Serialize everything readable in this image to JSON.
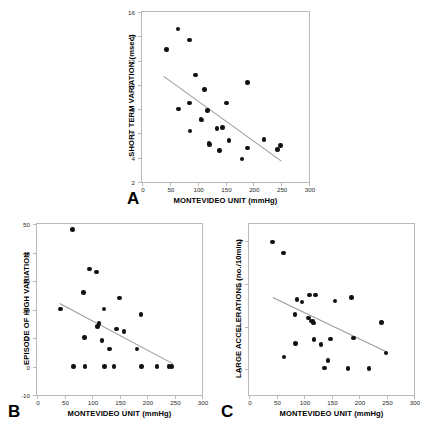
{
  "figure": {
    "panel_count": 3,
    "marker_color": "#111111",
    "fit_line_color": "#9a9a9a",
    "frame_color": "#b9b9b9"
  },
  "chart_data": [
    {
      "panel": "A",
      "type": "scatter",
      "title": "",
      "xlabel": "MONTEVIDEO UNIT (mmHg)",
      "ylabel": "SHORT TERM VARIATION (msec)",
      "xlim": [
        0,
        300
      ],
      "ylim": [
        2,
        16
      ],
      "xticks": [
        0,
        50,
        100,
        150,
        200,
        250,
        300
      ],
      "yticks": [
        2,
        4,
        6,
        8,
        10,
        12,
        14,
        16
      ],
      "grid": false,
      "legend": null,
      "points": [
        [
          44,
          12.9
        ],
        [
          65,
          14.6
        ],
        [
          66,
          8.0
        ],
        [
          85,
          13.7
        ],
        [
          85,
          8.5
        ],
        [
          86,
          6.2
        ],
        [
          96,
          10.8
        ],
        [
          106,
          7.2
        ],
        [
          107,
          7.1
        ],
        [
          112,
          9.6
        ],
        [
          118,
          7.9
        ],
        [
          120,
          5.2
        ],
        [
          121,
          5.1
        ],
        [
          135,
          6.4
        ],
        [
          139,
          4.6
        ],
        [
          145,
          6.5
        ],
        [
          152,
          8.5
        ],
        [
          156,
          5.4
        ],
        [
          180,
          3.9
        ],
        [
          189,
          10.2
        ],
        [
          190,
          4.8
        ],
        [
          219,
          5.5
        ],
        [
          243,
          4.7
        ],
        [
          249,
          5.0
        ]
      ],
      "fit_line": {
        "x0": 40,
        "y0": 10.7,
        "x1": 252,
        "y1": 3.7
      }
    },
    {
      "panel": "B",
      "type": "scatter",
      "title": "",
      "xlabel": "MONTEVIDEO UNIT (mmHg)",
      "ylabel": "EPISODE OF HIGH VARIATION",
      "xlim": [
        0,
        300
      ],
      "ylim": [
        -10,
        50
      ],
      "xticks": [
        0,
        50,
        100,
        150,
        200,
        250,
        300
      ],
      "yticks": [
        -10,
        0,
        10,
        20,
        30,
        40,
        50
      ],
      "grid": false,
      "legend": null,
      "points": [
        [
          43,
          20.2
        ],
        [
          65,
          48.0
        ],
        [
          66,
          0.0
        ],
        [
          85,
          26.0
        ],
        [
          86,
          10.2
        ],
        [
          87,
          0.0
        ],
        [
          95,
          34.2
        ],
        [
          108,
          33.1
        ],
        [
          110,
          14.0
        ],
        [
          113,
          15.1
        ],
        [
          118,
          9.1
        ],
        [
          122,
          20.2
        ],
        [
          123,
          0.0
        ],
        [
          132,
          6.1
        ],
        [
          140,
          0.0
        ],
        [
          145,
          13.1
        ],
        [
          150,
          24.0
        ],
        [
          158,
          12.2
        ],
        [
          182,
          6.1
        ],
        [
          189,
          18.2
        ],
        [
          190,
          0.0
        ],
        [
          218,
          0.0
        ],
        [
          240,
          0.0
        ],
        [
          245,
          0.0
        ]
      ],
      "fit_line": {
        "x0": 42,
        "y0": 22.2,
        "x1": 248,
        "y1": 1.0
      }
    },
    {
      "panel": "C",
      "type": "scatter",
      "title": "",
      "xlabel": "MONTEVIDEO UNIT (mmHg)",
      "ylabel": "LARGE ACCELERATIONS (no./10min)",
      "xlim": [
        0,
        300
      ],
      "ylim": [
        -0.6,
        3.4
      ],
      "xticks": [
        0,
        50,
        100,
        150,
        200,
        250,
        300
      ],
      "yticks": [
        0,
        1,
        2,
        3
      ],
      "grid": false,
      "legend": null,
      "points": [
        [
          43,
          2.98
        ],
        [
          63,
          2.72
        ],
        [
          64,
          0.29
        ],
        [
          84,
          1.28
        ],
        [
          85,
          0.6
        ],
        [
          87,
          1.64
        ],
        [
          96,
          1.58
        ],
        [
          108,
          1.2
        ],
        [
          110,
          1.74
        ],
        [
          113,
          1.13
        ],
        [
          116,
          1.12
        ],
        [
          117,
          1.08
        ],
        [
          118,
          0.7
        ],
        [
          121,
          1.74
        ],
        [
          131,
          0.58
        ],
        [
          137,
          0.03
        ],
        [
          144,
          0.21
        ],
        [
          148,
          0.71
        ],
        [
          156,
          1.6
        ],
        [
          180,
          0.02
        ],
        [
          186,
          1.68
        ],
        [
          190,
          0.73
        ],
        [
          218,
          0.02
        ],
        [
          241,
          1.09
        ],
        [
          249,
          0.38
        ]
      ],
      "fit_line": {
        "x0": 44,
        "y0": 1.7,
        "x1": 252,
        "y1": 0.42
      }
    }
  ],
  "panels": {
    "a": {
      "letter": "A",
      "xlabel": "MONTEVIDEO UNIT (mmHg)",
      "ylabel": "SHORT TERM VARIATION (msec)"
    },
    "b": {
      "letter": "B",
      "xlabel": "MONTEVIDEO UNIT (mmHg)",
      "ylabel": "EPISODE OF HIGH VARIATION"
    },
    "c": {
      "letter": "C",
      "xlabel": "MONTEVIDEO UNIT (mmHg)",
      "ylabel": "LARGE ACCELERATIONS (no./10min)"
    }
  }
}
